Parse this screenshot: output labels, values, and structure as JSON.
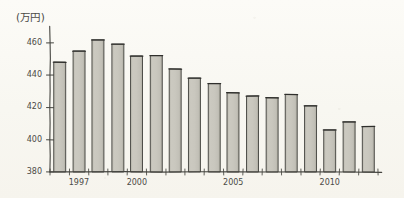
{
  "chart_data": {
    "type": "bar",
    "title": "",
    "subtitle": "",
    "unit_label": "(万円)",
    "xlabel": "",
    "ylabel": "",
    "ylim": [
      380,
      468
    ],
    "y_ticks": [
      380,
      400,
      420,
      440,
      460
    ],
    "y_tick_labels": [
      "380",
      "400",
      "420",
      "440",
      "460"
    ],
    "grid": false,
    "legend": null,
    "x_tick_labels": [
      "1997",
      "2000",
      "2005",
      "2010"
    ],
    "x_tick_categories": [
      "1997",
      "2000",
      "2005",
      "2010"
    ],
    "categories": [
      "1996",
      "1997",
      "1998",
      "1999",
      "2000",
      "2001",
      "2002",
      "2003",
      "2004",
      "2005",
      "2006",
      "2007",
      "2008",
      "2009",
      "2010",
      "2011",
      "2012"
    ],
    "values": [
      448,
      455,
      462,
      459,
      452,
      452,
      444,
      438,
      435,
      429,
      427,
      426,
      428,
      421,
      406,
      411,
      408
    ],
    "bar_fill_color": "#c8c6bd",
    "bar_edge_color": "#3f3f3b",
    "axis_color": "#44443f",
    "background_color": "#fbfaf6",
    "style": "hand-drawn-pencil"
  },
  "labels": {
    "unit": "(万円)"
  }
}
